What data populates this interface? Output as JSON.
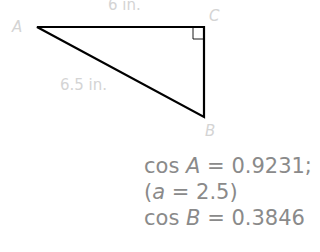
{
  "diagram": {
    "vertices": {
      "A": {
        "label": "A",
        "x": 37,
        "y": 27
      },
      "B": {
        "label": "B",
        "x": 204,
        "y": 117
      },
      "C": {
        "label": "C",
        "x": 204,
        "y": 27
      }
    },
    "side_labels": {
      "AC": "6 in.",
      "AB": "6.5 in."
    },
    "right_angle_at": "C",
    "colors": {
      "stroke": "#000000",
      "labels": "#d4d4d4",
      "equations": "#8a8a8a"
    }
  },
  "equations": {
    "line1": {
      "func": "cos",
      "var": "A",
      "eq": "=",
      "value": "0.9231;"
    },
    "line2": {
      "open": "(",
      "var": "a",
      "eq": "=",
      "value": "2.5",
      "close": ")"
    },
    "line3": {
      "func": "cos",
      "var": "B",
      "eq": "=",
      "value": "0.3846"
    }
  }
}
